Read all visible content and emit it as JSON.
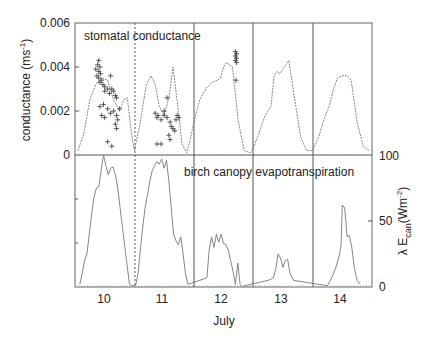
{
  "chart_data": [
    {
      "type": "line",
      "panel": "top",
      "title": "stomatal conductance",
      "xlabel": "July",
      "ylabel": "conductance (ms⁻¹)",
      "ylabel_parts": {
        "main": "conductance (ms",
        "sup": "-1",
        "end": ")"
      },
      "ylim": [
        0,
        0.006
      ],
      "yticks": [
        "0",
        "0.002",
        "0.004",
        "0.006"
      ],
      "categories": [
        "10",
        "11",
        "12",
        "13",
        "14"
      ],
      "series": [
        {
          "name": "modelled conductance (dotted line)",
          "x_day": [
            9.55,
            9.65,
            9.75,
            9.85,
            9.95,
            10.05,
            10.15,
            10.25,
            10.32,
            10.38,
            10.45,
            10.5,
            10.6,
            10.7,
            10.78,
            10.85,
            10.92,
            11.0,
            11.08,
            11.15,
            11.25,
            11.3,
            11.38,
            11.45,
            11.5,
            11.6,
            11.7,
            11.8,
            11.9,
            11.95,
            12.0,
            12.05,
            12.1,
            12.15,
            12.25,
            12.35,
            12.45,
            12.5,
            12.6,
            12.7,
            12.8,
            12.85,
            12.9,
            12.95,
            13.0,
            13.05,
            13.1,
            13.2,
            13.3,
            13.4,
            13.5,
            13.6,
            13.7,
            13.78,
            13.85,
            13.92,
            14.0,
            14.08,
            14.15,
            14.25,
            14.35,
            14.45
          ],
          "values": [
            0.0002,
            0.001,
            0.0025,
            0.0032,
            0.0035,
            0.0034,
            0.0025,
            0.002,
            0.0025,
            0.0026,
            0.001,
            0.0002,
            0.0015,
            0.0032,
            0.0036,
            0.0032,
            0.0022,
            0.0018,
            0.0026,
            0.004,
            0.0018,
            0.0005,
            0.0001,
            0.0008,
            0.0015,
            0.0025,
            0.003,
            0.0033,
            0.0034,
            0.0035,
            0.004,
            0.0042,
            0.0041,
            0.004,
            0.0015,
            0.0002,
            0.0001,
            0.0003,
            0.001,
            0.0018,
            0.0022,
            0.0036,
            0.0038,
            0.0037,
            0.0039,
            0.0041,
            0.0043,
            0.0025,
            0.0008,
            0.0002,
            0.0002,
            0.0008,
            0.0017,
            0.0022,
            0.003,
            0.0035,
            0.0036,
            0.0036,
            0.0034,
            0.0015,
            0.0004,
            0.0002
          ]
        },
        {
          "name": "measured conductance (+ markers)",
          "points": [
            [
              9.9,
              0.0043
            ],
            [
              9.88,
              0.0041
            ],
            [
              9.92,
              0.004
            ],
            [
              9.85,
              0.0039
            ],
            [
              9.9,
              0.0038
            ],
            [
              9.93,
              0.0037
            ],
            [
              9.87,
              0.0036
            ],
            [
              9.9,
              0.0035
            ],
            [
              9.95,
              0.0034
            ],
            [
              9.92,
              0.0033
            ],
            [
              9.97,
              0.0032
            ],
            [
              10.0,
              0.0031
            ],
            [
              10.05,
              0.003
            ],
            [
              10.1,
              0.0036
            ],
            [
              10.0,
              0.0029
            ],
            [
              10.08,
              0.0028
            ],
            [
              10.12,
              0.003
            ],
            [
              10.15,
              0.0029
            ],
            [
              10.18,
              0.0027
            ],
            [
              10.2,
              0.0026
            ],
            [
              9.92,
              0.0022
            ],
            [
              9.98,
              0.0023
            ],
            [
              10.05,
              0.0021
            ],
            [
              10.1,
              0.0019
            ],
            [
              10.15,
              0.002
            ],
            [
              10.2,
              0.0018
            ],
            [
              10.25,
              0.0021
            ],
            [
              10.22,
              0.0016
            ],
            [
              10.18,
              0.0014
            ],
            [
              10.2,
              0.0012
            ],
            [
              9.95,
              0.0018
            ],
            [
              10.0,
              0.0017
            ],
            [
              10.05,
              0.0006
            ],
            [
              10.12,
              0.0004
            ],
            [
              10.85,
              0.0019
            ],
            [
              10.9,
              0.0018
            ],
            [
              10.88,
              0.0017
            ],
            [
              10.95,
              0.0016
            ],
            [
              11.0,
              0.0018
            ],
            [
              11.05,
              0.0017
            ],
            [
              11.1,
              0.0015
            ],
            [
              11.12,
              0.0013
            ],
            [
              11.15,
              0.0012
            ],
            [
              11.18,
              0.0011
            ],
            [
              11.2,
              0.0016
            ],
            [
              11.22,
              0.0018
            ],
            [
              11.25,
              0.0017
            ],
            [
              11.05,
              0.0026
            ],
            [
              11.0,
              0.002
            ],
            [
              11.08,
              0.0009
            ],
            [
              11.1,
              0.0007
            ],
            [
              10.88,
              0.0005
            ],
            [
              10.95,
              0.0005
            ],
            [
              12.2,
              0.0047
            ],
            [
              12.22,
              0.0046
            ],
            [
              12.2,
              0.0045
            ],
            [
              12.22,
              0.0044
            ],
            [
              12.2,
              0.0043
            ],
            [
              12.22,
              0.0042
            ],
            [
              12.21,
              0.0034
            ]
          ]
        }
      ]
    },
    {
      "type": "line",
      "panel": "bottom",
      "title": "birch canopy evapotranspiration",
      "xlabel": "July",
      "ylabel": "λ E_can (Wm⁻²)",
      "ylabel_parts": {
        "lambda": "λ E",
        "sub": "can",
        "main": "(Wm",
        "sup": "-2",
        "end": ")"
      },
      "ylim": [
        0,
        100
      ],
      "yticks": [
        "0",
        "50",
        "100"
      ],
      "categories": [
        "10",
        "11",
        "12",
        "13",
        "14"
      ],
      "series": [
        {
          "name": "lambda E_can",
          "x_day": [
            9.58,
            9.62,
            9.66,
            9.7,
            9.74,
            9.78,
            9.82,
            9.86,
            9.9,
            9.94,
            9.98,
            10.02,
            10.06,
            10.1,
            10.14,
            10.18,
            10.22,
            10.26,
            10.3,
            10.34,
            10.38,
            10.42,
            10.46,
            10.52,
            10.56,
            10.6,
            10.64,
            10.68,
            10.72,
            10.76,
            10.8,
            10.84,
            10.88,
            10.92,
            10.96,
            11.0,
            11.04,
            11.08,
            11.12,
            11.16,
            11.2,
            11.24,
            11.28,
            11.32,
            11.36,
            11.4,
            11.72,
            11.76,
            11.8,
            11.84,
            11.88,
            11.92,
            11.96,
            12.0,
            12.04,
            12.08,
            12.12,
            12.16,
            12.2,
            12.24,
            12.28,
            12.32,
            12.36,
            12.75,
            12.8,
            12.84,
            12.88,
            12.92,
            12.96,
            13.0,
            13.04,
            13.08,
            13.12,
            13.18,
            13.75,
            13.8,
            13.85,
            13.9,
            13.95,
            13.98,
            14.0,
            14.04,
            14.08,
            14.12,
            14.16,
            14.2,
            14.25,
            14.3
          ],
          "values": [
            2,
            10,
            20,
            25,
            40,
            55,
            68,
            75,
            76,
            88,
            100,
            92,
            85,
            90,
            91,
            85,
            75,
            60,
            45,
            30,
            15,
            2,
            1,
            1,
            10,
            28,
            45,
            60,
            70,
            80,
            88,
            92,
            95,
            93,
            97,
            90,
            96,
            80,
            60,
            40,
            35,
            32,
            38,
            25,
            10,
            2,
            7,
            28,
            38,
            30,
            40,
            34,
            40,
            33,
            32,
            28,
            20,
            12,
            2,
            18,
            2,
            0,
            1,
            5,
            6,
            7,
            14,
            25,
            22,
            15,
            20,
            21,
            10,
            5,
            1,
            5,
            10,
            16,
            24,
            32,
            62,
            60,
            38,
            39,
            30,
            15,
            5,
            2
          ]
        }
      ]
    }
  ],
  "labels": {
    "top_title": "stomatal conductance",
    "bottom_title": "birch canopy evapotranspiration",
    "xlabel": "July",
    "days": [
      "10",
      "11",
      "12",
      "13",
      "14"
    ],
    "left_ticks": [
      "0.006",
      "0.004",
      "0.002",
      "0"
    ],
    "right_ticks": [
      "100",
      "50",
      "0"
    ],
    "left_ylabel_main": "conductance (ms",
    "left_ylabel_sup": "-1",
    "left_ylabel_end": ")",
    "right_ylabel_lambda": "λ E",
    "right_ylabel_sub": "can",
    "right_ylabel_main": "(Wm",
    "right_ylabel_sup": "-2",
    "right_ylabel_end": ")"
  },
  "colors": {
    "frame": "#555555",
    "line": "#777777",
    "marker": "#333333",
    "text": "#222222"
  }
}
